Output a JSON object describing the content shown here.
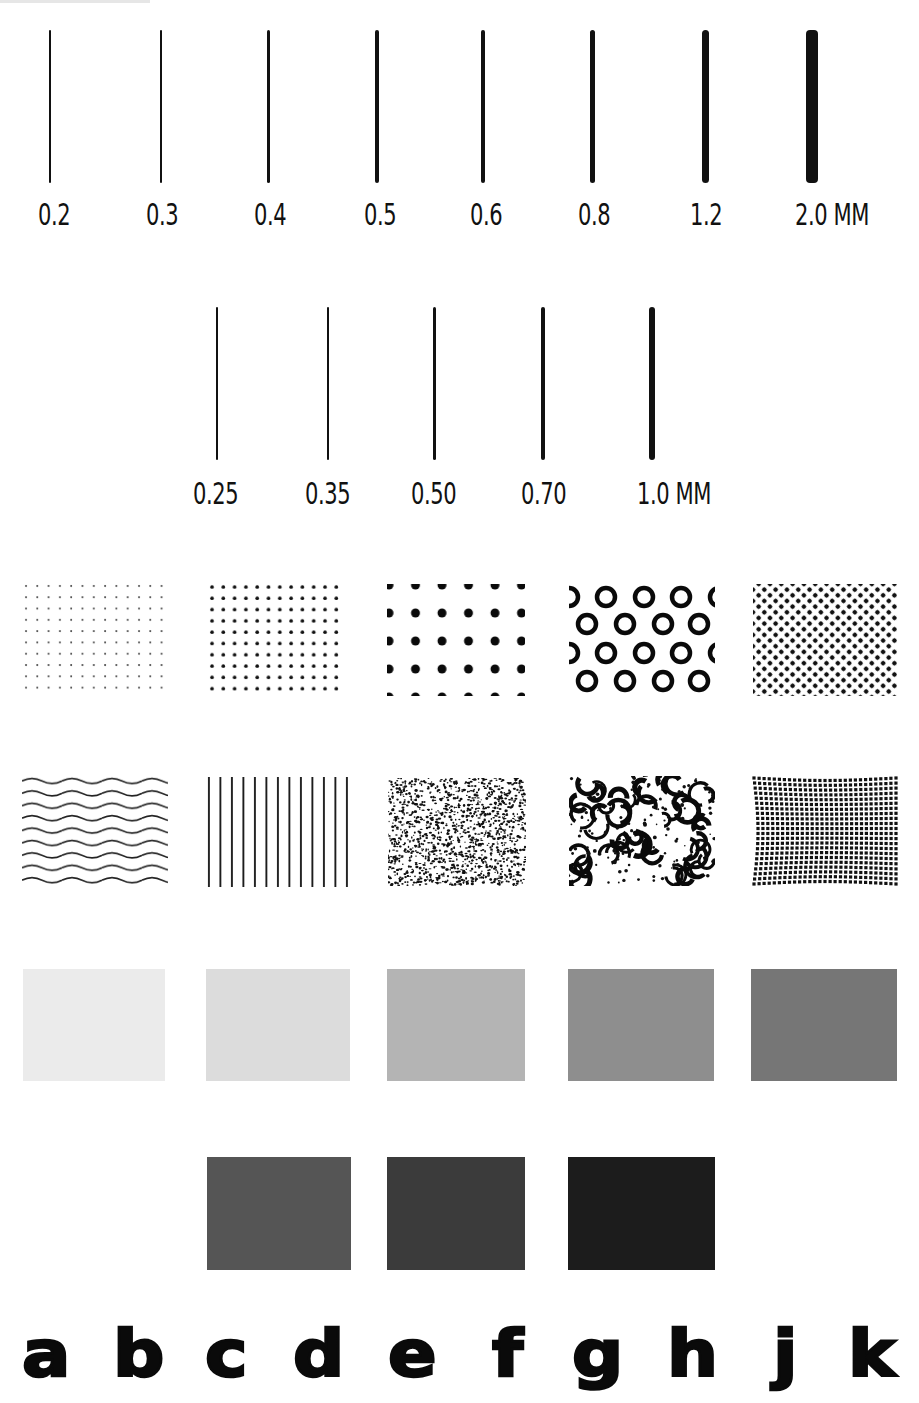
{
  "line_weights_row1": {
    "unit": "MM",
    "items": [
      {
        "label": "0.2",
        "x": 50,
        "w": 1.5,
        "lx": 38
      },
      {
        "label": "0.3",
        "x": 161,
        "w": 2,
        "lx": 146
      },
      {
        "label": "0.4",
        "x": 268,
        "w": 3,
        "lx": 254
      },
      {
        "label": "0.5",
        "x": 377,
        "w": 3.5,
        "lx": 364
      },
      {
        "label": "0.6",
        "x": 483,
        "w": 4,
        "lx": 470
      },
      {
        "label": "0.8",
        "x": 592,
        "w": 5,
        "lx": 578
      },
      {
        "label": "1.2",
        "x": 705,
        "w": 7,
        "lx": 690
      },
      {
        "label": "2.0 MM",
        "x": 812,
        "w": 12,
        "lx": 795
      }
    ]
  },
  "line_weights_row2": {
    "unit": "MM",
    "items": [
      {
        "label": "0.25",
        "x": 217,
        "w": 1.2,
        "lx": 193
      },
      {
        "label": "0.35",
        "x": 328,
        "w": 2,
        "lx": 305
      },
      {
        "label": "0.50",
        "x": 434,
        "w": 3,
        "lx": 411
      },
      {
        "label": "0.70",
        "x": 543,
        "w": 4.5,
        "lx": 521
      },
      {
        "label": "1.0 MM",
        "x": 652,
        "w": 6,
        "lx": 637
      }
    ]
  },
  "pattern_row1": [
    {
      "name": "fine-dot-grid",
      "desc": "fine dot grid"
    },
    {
      "name": "medium-dot-grid",
      "desc": "medium dot grid"
    },
    {
      "name": "large-dot-grid",
      "desc": "large offset dots"
    },
    {
      "name": "ring-pattern",
      "desc": "hollow rings"
    },
    {
      "name": "dense-halftone",
      "desc": "dense halftone dots"
    }
  ],
  "pattern_row2": [
    {
      "name": "wavy-lines",
      "desc": "horizontal wavy lines"
    },
    {
      "name": "vertical-lines",
      "desc": "vertical lines"
    },
    {
      "name": "stipple",
      "desc": "fine stipple texture"
    },
    {
      "name": "coarse-mottle",
      "desc": "coarse mottled texture"
    },
    {
      "name": "warped-grid",
      "desc": "warped dot grid"
    }
  ],
  "gray_row1": [
    {
      "name": "gray-10",
      "color": "#ebebeb"
    },
    {
      "name": "gray-20",
      "color": "#dcdcdc"
    },
    {
      "name": "gray-35",
      "color": "#b4b4b4"
    },
    {
      "name": "gray-50",
      "color": "#8e8e8e"
    },
    {
      "name": "gray-60",
      "color": "#767676"
    }
  ],
  "gray_row2": [
    {
      "name": "gray-70",
      "color": "#555555"
    },
    {
      "name": "gray-80",
      "color": "#3b3b3b"
    },
    {
      "name": "gray-90",
      "color": "#1c1c1c"
    }
  ],
  "letters": [
    {
      "char": "a",
      "x": 22
    },
    {
      "char": "b",
      "x": 113
    },
    {
      "char": "c",
      "x": 205
    },
    {
      "char": "d",
      "x": 293
    },
    {
      "char": "e",
      "x": 388
    },
    {
      "char": "f",
      "x": 492
    },
    {
      "char": "g",
      "x": 572
    },
    {
      "char": "h",
      "x": 667
    },
    {
      "char": "j",
      "x": 773
    },
    {
      "char": "k",
      "x": 848
    }
  ]
}
